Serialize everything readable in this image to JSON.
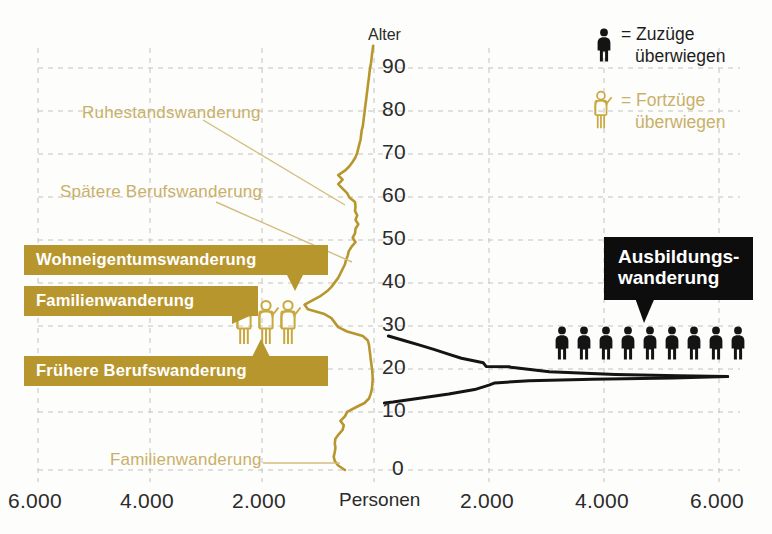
{
  "chart_data": {
    "type": "line",
    "title": "",
    "subtitle": "",
    "xlabel": "Personen",
    "ylabel": "Alter",
    "grid": true,
    "legend_position": "top-right",
    "orientation": "horizontal-diverging",
    "x_axis": {
      "left_ticks": [
        "6.000",
        "4.000",
        "2.000"
      ],
      "center_label": "Personen",
      "right_ticks": [
        "2.000",
        "4.000",
        "6.000"
      ],
      "range_each_side": [
        0,
        6500
      ]
    },
    "y_axis": {
      "label": "Alter",
      "ticks": [
        90,
        80,
        70,
        60,
        50,
        40,
        30,
        20,
        10,
        0
      ],
      "ylim": [
        0,
        95
      ]
    },
    "series": [
      {
        "name": "Fortzüge überwiegen",
        "color": "#b8962e",
        "side": "left",
        "points": [
          {
            "age": 0,
            "value": 520
          },
          {
            "age": 1,
            "value": 640
          },
          {
            "age": 2,
            "value": 700
          },
          {
            "age": 3,
            "value": 720
          },
          {
            "age": 4,
            "value": 700
          },
          {
            "age": 5,
            "value": 690
          },
          {
            "age": 6,
            "value": 700
          },
          {
            "age": 7,
            "value": 690
          },
          {
            "age": 8,
            "value": 630
          },
          {
            "age": 9,
            "value": 560
          },
          {
            "age": 10,
            "value": 540
          },
          {
            "age": 11,
            "value": 600
          },
          {
            "age": 12,
            "value": 520
          },
          {
            "age": 13,
            "value": 480
          },
          {
            "age": 14,
            "value": 330
          },
          {
            "age": 15,
            "value": 170
          },
          {
            "age": 16,
            "value": 90
          },
          {
            "age": 17,
            "value": 60
          },
          {
            "age": 18,
            "value": 40
          },
          {
            "age": 19,
            "value": 30
          },
          {
            "age": 20,
            "value": 25
          },
          {
            "age": 21,
            "value": 25
          },
          {
            "age": 22,
            "value": 30
          },
          {
            "age": 23,
            "value": 40
          },
          {
            "age": 24,
            "value": 50
          },
          {
            "age": 25,
            "value": 60
          },
          {
            "age": 26,
            "value": 70
          },
          {
            "age": 27,
            "value": 80
          },
          {
            "age": 28,
            "value": 90
          },
          {
            "age": 29,
            "value": 110
          },
          {
            "age": 30,
            "value": 200
          },
          {
            "age": 31,
            "value": 480
          },
          {
            "age": 32,
            "value": 640
          },
          {
            "age": 33,
            "value": 700
          },
          {
            "age": 34,
            "value": 760
          },
          {
            "age": 35,
            "value": 900
          },
          {
            "age": 36,
            "value": 1180
          },
          {
            "age": 37,
            "value": 1240
          },
          {
            "age": 38,
            "value": 1100
          },
          {
            "age": 39,
            "value": 950
          },
          {
            "age": 40,
            "value": 840
          },
          {
            "age": 41,
            "value": 760
          },
          {
            "age": 42,
            "value": 700
          },
          {
            "age": 43,
            "value": 640
          },
          {
            "age": 44,
            "value": 600
          },
          {
            "age": 45,
            "value": 560
          },
          {
            "age": 46,
            "value": 520
          },
          {
            "age": 47,
            "value": 500
          },
          {
            "age": 48,
            "value": 470
          },
          {
            "age": 49,
            "value": 450
          },
          {
            "age": 50,
            "value": 400
          },
          {
            "age": 51,
            "value": 330
          },
          {
            "age": 52,
            "value": 380
          },
          {
            "age": 53,
            "value": 340
          },
          {
            "age": 54,
            "value": 330
          },
          {
            "age": 55,
            "value": 280
          },
          {
            "age": 56,
            "value": 330
          },
          {
            "age": 57,
            "value": 300
          },
          {
            "age": 58,
            "value": 340
          },
          {
            "age": 59,
            "value": 330
          },
          {
            "age": 60,
            "value": 340
          },
          {
            "age": 61,
            "value": 440
          },
          {
            "age": 62,
            "value": 480
          },
          {
            "age": 63,
            "value": 560
          },
          {
            "age": 64,
            "value": 640
          },
          {
            "age": 65,
            "value": 560
          },
          {
            "age": 66,
            "value": 640
          },
          {
            "age": 67,
            "value": 520
          },
          {
            "age": 68,
            "value": 440
          },
          {
            "age": 69,
            "value": 380
          },
          {
            "age": 70,
            "value": 330
          },
          {
            "age": 71,
            "value": 300
          },
          {
            "age": 72,
            "value": 280
          },
          {
            "age": 73,
            "value": 260
          },
          {
            "age": 74,
            "value": 240
          },
          {
            "age": 75,
            "value": 230
          },
          {
            "age": 76,
            "value": 220
          },
          {
            "age": 77,
            "value": 200
          },
          {
            "age": 78,
            "value": 190
          },
          {
            "age": 79,
            "value": 180
          },
          {
            "age": 80,
            "value": 170
          },
          {
            "age": 81,
            "value": 160
          },
          {
            "age": 82,
            "value": 150
          },
          {
            "age": 83,
            "value": 140
          },
          {
            "age": 84,
            "value": 130
          },
          {
            "age": 85,
            "value": 120
          },
          {
            "age": 86,
            "value": 110
          },
          {
            "age": 87,
            "value": 100
          },
          {
            "age": 88,
            "value": 90
          },
          {
            "age": 89,
            "value": 80
          },
          {
            "age": 90,
            "value": 70
          },
          {
            "age": 91,
            "value": 55
          },
          {
            "age": 92,
            "value": 45
          },
          {
            "age": 93,
            "value": 35
          },
          {
            "age": 94,
            "value": 25
          },
          {
            "age": 95,
            "value": 15
          }
        ]
      },
      {
        "name": "Zuzüge überwiegen (obere Kontur)",
        "color": "#141414",
        "side": "right",
        "points": [
          {
            "age": 30,
            "value": 250
          },
          {
            "age": 29,
            "value": 520
          },
          {
            "age": 28,
            "value": 780
          },
          {
            "age": 27,
            "value": 1040
          },
          {
            "age": 26,
            "value": 1280
          },
          {
            "age": 25,
            "value": 1520
          },
          {
            "age": 24,
            "value": 1900
          },
          {
            "age": 23.2,
            "value": 1950
          },
          {
            "age": 23.1,
            "value": 2350
          },
          {
            "age": 23,
            "value": 2380
          },
          {
            "age": 22,
            "value": 3050
          },
          {
            "age": 21.4,
            "value": 4200
          },
          {
            "age": 21.1,
            "value": 5300
          },
          {
            "age": 21.0,
            "value": 5850
          },
          {
            "age": 20.9,
            "value": 6150
          }
        ]
      },
      {
        "name": "Zuzüge überwiegen (untere Kontur)",
        "color": "#141414",
        "side": "right",
        "points": [
          {
            "age": 15.0,
            "value": 180
          },
          {
            "age": 15.2,
            "value": 330
          },
          {
            "age": 16,
            "value": 760
          },
          {
            "age": 17,
            "value": 1300
          },
          {
            "age": 18,
            "value": 1750
          },
          {
            "age": 19,
            "value": 2000
          },
          {
            "age": 19.5,
            "value": 2100
          },
          {
            "age": 20,
            "value": 2700
          },
          {
            "age": 20.3,
            "value": 3800
          },
          {
            "age": 20.6,
            "value": 5200
          },
          {
            "age": 20.9,
            "value": 6150
          }
        ]
      }
    ],
    "annotations": [
      {
        "text": "Ruhestandswanderung",
        "style": "soft-gold",
        "target_age": 65
      },
      {
        "text": "Spätere Berufswanderung",
        "style": "soft-gold",
        "target_age": 50
      },
      {
        "text": "Wohneigentumswanderung",
        "style": "bubble-gold",
        "target_age": 44
      },
      {
        "text": "Familienwanderung",
        "style": "bubble-gold",
        "target_age": 36
      },
      {
        "text": "Frühere Berufswanderung",
        "style": "bubble-gold",
        "target_age": 31
      },
      {
        "text": "Familienwanderung",
        "style": "soft-gold",
        "target_age": 2
      },
      {
        "text": "Ausbildungs-wanderung",
        "style": "bubble-black",
        "target_age": 21
      }
    ]
  },
  "axis": {
    "y_caption": "Alter",
    "y_ticks": [
      "90",
      "80",
      "70",
      "60",
      "50",
      "40",
      "30",
      "20",
      "10",
      "0"
    ],
    "x_left": [
      "6.000",
      "4.000",
      "2.000"
    ],
    "x_center": "Personen",
    "x_right": [
      "2.000",
      "4.000",
      "6.000"
    ]
  },
  "legend": {
    "items": [
      {
        "icon": "person-black-icon",
        "equals": "=",
        "line1": "Zuzüge",
        "line2": "überwiegen",
        "color": "#1d1d1d"
      },
      {
        "icon": "person-gold-icon",
        "equals": "=",
        "line1": "Fortzüge",
        "line2": "überwiegen",
        "color": "#c9b06a"
      }
    ]
  },
  "callouts": {
    "ruhestand": "Ruhestandswanderung",
    "spaetere_beruf": "Spätere Berufswanderung",
    "wohneigentum": "Wohneigentumswanderung",
    "familien_mitte": "Familienwanderung",
    "fruehere_beruf": "Frühere Berufswanderung",
    "familien_unten": "Familienwanderung",
    "ausbildung_l1": "Ausbildungs-",
    "ausbildung_l2": "wanderung"
  },
  "colors": {
    "gold_solid": "#b8962e",
    "gold_soft": "#c9b06a",
    "black": "#141414",
    "grid": "#bdbdbd",
    "background": "#fdfdfb"
  },
  "figures": {
    "gold_group_count": 3,
    "black_group_count": 9
  }
}
